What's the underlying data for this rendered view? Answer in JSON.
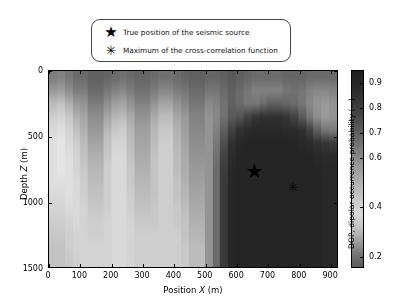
{
  "legend": {
    "items": [
      {
        "marker": "star-marker",
        "glyph": "★",
        "label": "True position of the seismic source"
      },
      {
        "marker": "asterisk-marker",
        "glyph": "✳",
        "label": "Maximum of the cross-correlation function"
      }
    ]
  },
  "chart_data": {
    "type": "heatmap",
    "title": "",
    "xlabel_prefix": "Position ",
    "xlabel_var": "X",
    "xlabel_suffix": " (m)",
    "ylabel_prefix": "Depth ",
    "ylabel_var": "Z",
    "ylabel_suffix": " (m)",
    "xlim": [
      0,
      925
    ],
    "ylim": [
      0,
      1500
    ],
    "y_inverted": true,
    "xticks": [
      0,
      100,
      200,
      300,
      400,
      500,
      600,
      700,
      800,
      900
    ],
    "xticklabels": [
      "0",
      "100",
      "200",
      "300",
      "400",
      "500",
      "600",
      "700",
      "800",
      "900"
    ],
    "yticks": [
      0,
      500,
      1000,
      1500
    ],
    "yticklabels": [
      "0",
      "500",
      "1000",
      "1500"
    ],
    "grid": false,
    "colormap": "gray-inverted",
    "clim": [
      0.15,
      0.95
    ],
    "colorbar": {
      "label": "DOP, dipolar occurrence probability (—)",
      "ticks": [
        0.2,
        0.4,
        0.6,
        0.7,
        0.8,
        0.9
      ],
      "ticklabels": [
        "0.2",
        "0.4",
        "0.6",
        "0.7",
        "0.8",
        "0.9"
      ],
      "position": "right",
      "orientation": "vertical"
    },
    "x_cell_edges": [
      0,
      25,
      50,
      75,
      100,
      125,
      150,
      175,
      200,
      225,
      250,
      275,
      300,
      325,
      350,
      375,
      400,
      425,
      450,
      475,
      500,
      525,
      550,
      575,
      600,
      625,
      650,
      675,
      700,
      725,
      750,
      775,
      800,
      825,
      850,
      875,
      900,
      925
    ],
    "z_cell_edges": [
      0,
      100,
      200,
      300,
      400,
      500,
      600,
      700,
      800,
      900,
      1000,
      1100,
      1200,
      1300,
      1400,
      1500
    ],
    "values": [
      [
        0.6,
        0.58,
        0.62,
        0.66,
        0.66,
        0.7,
        0.7,
        0.68,
        0.66,
        0.64,
        0.66,
        0.68,
        0.68,
        0.66,
        0.64,
        0.64,
        0.66,
        0.68,
        0.7,
        0.7,
        0.68,
        0.68,
        0.7,
        0.72,
        0.7,
        0.68,
        0.66,
        0.66,
        0.66,
        0.66,
        0.68,
        0.68,
        0.68,
        0.66,
        0.66,
        0.66,
        0.66
      ],
      [
        0.5,
        0.48,
        0.54,
        0.6,
        0.6,
        0.66,
        0.66,
        0.62,
        0.58,
        0.56,
        0.6,
        0.64,
        0.64,
        0.6,
        0.56,
        0.56,
        0.6,
        0.62,
        0.66,
        0.66,
        0.62,
        0.62,
        0.66,
        0.7,
        0.66,
        0.62,
        0.58,
        0.58,
        0.58,
        0.58,
        0.62,
        0.64,
        0.62,
        0.58,
        0.56,
        0.56,
        0.58
      ],
      [
        0.38,
        0.36,
        0.42,
        0.5,
        0.52,
        0.6,
        0.6,
        0.54,
        0.48,
        0.46,
        0.52,
        0.58,
        0.58,
        0.52,
        0.46,
        0.46,
        0.52,
        0.56,
        0.62,
        0.62,
        0.56,
        0.58,
        0.64,
        0.7,
        0.66,
        0.62,
        0.62,
        0.66,
        0.7,
        0.7,
        0.68,
        0.66,
        0.62,
        0.56,
        0.52,
        0.5,
        0.52
      ],
      [
        0.32,
        0.3,
        0.34,
        0.42,
        0.46,
        0.54,
        0.54,
        0.46,
        0.4,
        0.38,
        0.44,
        0.52,
        0.52,
        0.44,
        0.38,
        0.38,
        0.46,
        0.5,
        0.58,
        0.58,
        0.52,
        0.56,
        0.64,
        0.72,
        0.74,
        0.8,
        0.84,
        0.86,
        0.86,
        0.86,
        0.84,
        0.8,
        0.72,
        0.62,
        0.54,
        0.5,
        0.52
      ],
      [
        0.28,
        0.26,
        0.3,
        0.36,
        0.42,
        0.5,
        0.5,
        0.4,
        0.34,
        0.32,
        0.4,
        0.48,
        0.48,
        0.4,
        0.34,
        0.34,
        0.42,
        0.48,
        0.56,
        0.56,
        0.52,
        0.58,
        0.7,
        0.8,
        0.86,
        0.88,
        0.89,
        0.89,
        0.89,
        0.89,
        0.88,
        0.88,
        0.86,
        0.8,
        0.7,
        0.62,
        0.6
      ],
      [
        0.26,
        0.24,
        0.28,
        0.32,
        0.38,
        0.46,
        0.46,
        0.36,
        0.3,
        0.3,
        0.38,
        0.46,
        0.46,
        0.38,
        0.32,
        0.32,
        0.4,
        0.46,
        0.54,
        0.54,
        0.52,
        0.62,
        0.76,
        0.86,
        0.89,
        0.9,
        0.9,
        0.9,
        0.9,
        0.9,
        0.9,
        0.9,
        0.89,
        0.88,
        0.86,
        0.84,
        0.82
      ],
      [
        0.26,
        0.24,
        0.26,
        0.3,
        0.36,
        0.42,
        0.42,
        0.34,
        0.28,
        0.28,
        0.36,
        0.44,
        0.44,
        0.36,
        0.32,
        0.32,
        0.38,
        0.44,
        0.52,
        0.52,
        0.52,
        0.64,
        0.8,
        0.88,
        0.9,
        0.9,
        0.9,
        0.9,
        0.9,
        0.9,
        0.9,
        0.9,
        0.9,
        0.9,
        0.89,
        0.88,
        0.88
      ],
      [
        0.26,
        0.24,
        0.26,
        0.3,
        0.34,
        0.4,
        0.4,
        0.32,
        0.28,
        0.28,
        0.34,
        0.42,
        0.42,
        0.36,
        0.32,
        0.32,
        0.38,
        0.44,
        0.5,
        0.5,
        0.52,
        0.66,
        0.82,
        0.89,
        0.9,
        0.9,
        0.9,
        0.9,
        0.9,
        0.9,
        0.9,
        0.9,
        0.9,
        0.9,
        0.9,
        0.89,
        0.89
      ],
      [
        0.26,
        0.26,
        0.26,
        0.28,
        0.32,
        0.38,
        0.38,
        0.32,
        0.28,
        0.28,
        0.34,
        0.4,
        0.4,
        0.36,
        0.32,
        0.32,
        0.36,
        0.42,
        0.48,
        0.48,
        0.52,
        0.66,
        0.83,
        0.89,
        0.9,
        0.9,
        0.9,
        0.9,
        0.9,
        0.9,
        0.9,
        0.9,
        0.9,
        0.9,
        0.9,
        0.89,
        0.89
      ],
      [
        0.28,
        0.28,
        0.26,
        0.28,
        0.32,
        0.36,
        0.36,
        0.32,
        0.28,
        0.28,
        0.32,
        0.38,
        0.38,
        0.36,
        0.32,
        0.32,
        0.36,
        0.4,
        0.46,
        0.46,
        0.52,
        0.66,
        0.83,
        0.89,
        0.9,
        0.9,
        0.9,
        0.9,
        0.9,
        0.9,
        0.9,
        0.9,
        0.9,
        0.9,
        0.9,
        0.89,
        0.89
      ],
      [
        0.3,
        0.3,
        0.28,
        0.28,
        0.3,
        0.34,
        0.34,
        0.32,
        0.28,
        0.28,
        0.32,
        0.36,
        0.36,
        0.34,
        0.32,
        0.32,
        0.34,
        0.38,
        0.44,
        0.44,
        0.52,
        0.66,
        0.83,
        0.89,
        0.9,
        0.9,
        0.9,
        0.9,
        0.9,
        0.9,
        0.9,
        0.9,
        0.9,
        0.9,
        0.9,
        0.89,
        0.89
      ],
      [
        0.32,
        0.32,
        0.3,
        0.28,
        0.3,
        0.32,
        0.32,
        0.3,
        0.28,
        0.28,
        0.3,
        0.34,
        0.34,
        0.34,
        0.32,
        0.32,
        0.34,
        0.36,
        0.42,
        0.42,
        0.52,
        0.66,
        0.83,
        0.89,
        0.9,
        0.9,
        0.9,
        0.9,
        0.9,
        0.9,
        0.9,
        0.9,
        0.9,
        0.9,
        0.9,
        0.89,
        0.89
      ],
      [
        0.34,
        0.34,
        0.32,
        0.3,
        0.3,
        0.32,
        0.32,
        0.3,
        0.28,
        0.28,
        0.3,
        0.32,
        0.32,
        0.32,
        0.32,
        0.32,
        0.32,
        0.36,
        0.4,
        0.4,
        0.52,
        0.66,
        0.83,
        0.89,
        0.9,
        0.9,
        0.9,
        0.9,
        0.9,
        0.9,
        0.9,
        0.9,
        0.9,
        0.9,
        0.9,
        0.89,
        0.89
      ],
      [
        0.36,
        0.36,
        0.32,
        0.3,
        0.3,
        0.3,
        0.3,
        0.3,
        0.28,
        0.28,
        0.3,
        0.32,
        0.32,
        0.32,
        0.32,
        0.32,
        0.32,
        0.34,
        0.38,
        0.38,
        0.52,
        0.66,
        0.83,
        0.89,
        0.9,
        0.9,
        0.9,
        0.9,
        0.9,
        0.9,
        0.9,
        0.9,
        0.9,
        0.9,
        0.9,
        0.89,
        0.89
      ],
      [
        0.36,
        0.36,
        0.34,
        0.32,
        0.3,
        0.3,
        0.3,
        0.3,
        0.28,
        0.28,
        0.3,
        0.32,
        0.32,
        0.32,
        0.32,
        0.32,
        0.32,
        0.34,
        0.38,
        0.38,
        0.52,
        0.66,
        0.83,
        0.89,
        0.9,
        0.9,
        0.9,
        0.9,
        0.9,
        0.9,
        0.9,
        0.9,
        0.9,
        0.9,
        0.9,
        0.89,
        0.89
      ]
    ],
    "annotations": [
      {
        "name": "true-source",
        "glyph": "★",
        "x": 655,
        "z": 755
      },
      {
        "name": "cross-correlation-max",
        "glyph": "✳",
        "x": 778,
        "z": 880
      }
    ]
  }
}
